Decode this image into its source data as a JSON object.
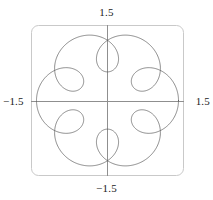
{
  "figure": {
    "kind": "parametric-plot",
    "labels": {
      "top": "1.5",
      "bottom": "−1.5",
      "left": "−1.5",
      "right": "1.5"
    },
    "colors": {
      "curve": "#595959",
      "axis": "#8c8c8c",
      "frame": "#c8c8c8",
      "background": "#ffffff",
      "text": "#1a1a1a"
    }
  },
  "chart_data": {
    "type": "line",
    "title": "",
    "xlabel": "",
    "ylabel": "",
    "xlim": [
      -1.5,
      1.5
    ],
    "ylim": [
      -1.5,
      1.5
    ],
    "grid": false,
    "legend": null,
    "xticks": [
      -1.5,
      1.5
    ],
    "yticks": [
      -1.5,
      1.5
    ],
    "xticklabels": [
      "−1.5",
      "1.5"
    ],
    "yticklabels": [
      "−1.5",
      "1.5"
    ],
    "axes_style": "crossed-axes-at-origin-with-rounded-frame",
    "symmetry_order": 6,
    "series": [
      {
        "name": "curve",
        "parametric": true,
        "t_range": [
          0,
          6.283185307179586
        ],
        "equations": {
          "x": "cos(t) + 0.42*cos(7*t)",
          "y": "sin(t) + 0.42*sin(7*t)"
        },
        "closed": true,
        "n_points": 1200,
        "color": "#595959",
        "linewidth": 0.7
      }
    ]
  }
}
